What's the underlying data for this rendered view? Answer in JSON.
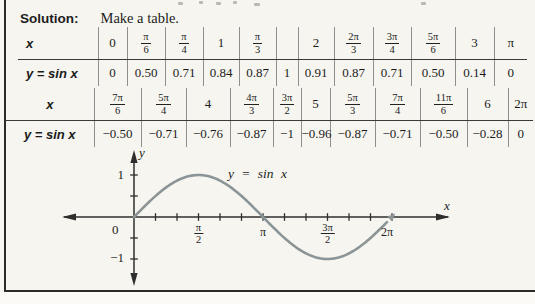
{
  "solution": {
    "label": "Solution:",
    "text": "Make a table."
  },
  "tables": [
    {
      "row1_label": "x",
      "row2_label": "y = sin x",
      "x": [
        "0",
        "π/6",
        "π/4",
        "1",
        "π/3",
        "",
        "2",
        "2π/3",
        "3π/4",
        "5π/6",
        "3",
        "π"
      ],
      "y": [
        "0",
        "0.50",
        "0.71",
        "0.84",
        "0.87",
        "1",
        "0.91",
        "0.87",
        "0.71",
        "0.50",
        "0.14",
        "0"
      ]
    },
    {
      "row1_label": "x",
      "row2_label": "y = sin x",
      "x": [
        "7π/6",
        "5π/4",
        "4",
        "4π/3",
        "3π/2",
        "5",
        "5π/3",
        "7π/4",
        "11π/6",
        "6",
        "2π"
      ],
      "y": [
        "−0.50",
        "−0.71",
        "−0.76",
        "−0.87",
        "−1",
        "−0.96",
        "−0.87",
        "−0.71",
        "−0.50",
        "−0.28",
        "0"
      ]
    }
  ],
  "chart_data": {
    "type": "line",
    "curve_label": "y = sin x",
    "xlabel": "x",
    "ylabel": "y",
    "origin_label": "0",
    "x_tick_labels": [
      "π/2",
      "π",
      "3π/2",
      "2π"
    ],
    "x_tick_values": [
      1.5708,
      3.1416,
      4.7124,
      6.2832
    ],
    "y_tick_labels": [
      "1",
      "−1"
    ],
    "y_tick_values": [
      1,
      -1
    ],
    "minor_tick_step": 0.5236,
    "xlim": [
      0,
      6.2832
    ],
    "ylim": [
      -1,
      1
    ],
    "grid": false,
    "curve_color": "#8b9496",
    "axis_color": "#2e2e2e",
    "x": [
      0,
      0.5236,
      0.7854,
      1,
      1.0472,
      1.5708,
      2,
      2.0944,
      2.3562,
      2.618,
      3,
      3.1416,
      3.6652,
      3.927,
      4,
      4.1888,
      4.7124,
      5,
      5.236,
      5.4978,
      5.7596,
      6,
      6.2832
    ],
    "y": [
      0,
      0.5,
      0.71,
      0.84,
      0.87,
      1,
      0.91,
      0.87,
      0.71,
      0.5,
      0.14,
      0,
      -0.5,
      -0.71,
      -0.76,
      -0.87,
      -1,
      -0.96,
      -0.87,
      -0.71,
      -0.5,
      -0.28,
      0
    ]
  }
}
